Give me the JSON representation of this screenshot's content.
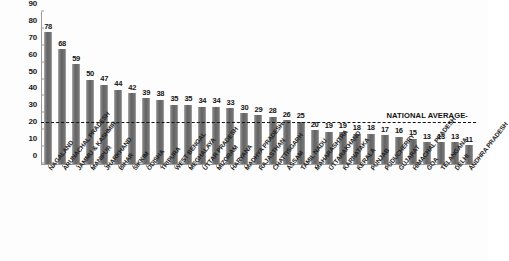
{
  "chart_data": {
    "type": "bar",
    "title": "",
    "subtitle": "",
    "xlabel": "",
    "ylabel": "",
    "ylim": [
      0,
      90
    ],
    "yticks": [
      0,
      10,
      20,
      30,
      40,
      50,
      60,
      70,
      80,
      90
    ],
    "grid": false,
    "legend": null,
    "bar_color": "#6e6e6e",
    "categories": [
      "NAGALAND",
      "ARUNACHAL PRADESH",
      "JAMMU & KASHMIR",
      "MANIPUR",
      "JHARKHAND",
      "BIHAR",
      "SIKKIM",
      "ODISHA",
      "TRIPURA",
      "WEST BENGAL",
      "MEGHALAYA",
      "UTTAR PRADESH",
      "MIZORAM",
      "HARYANA",
      "MADHYA PRADESH",
      "RAJASTHAN",
      "CHATTISGARH",
      "ASSAM",
      "TAMIL NADU",
      "MAHARASHTRA",
      "UTTARAKHAND",
      "KARNATAKA",
      "KERALA",
      "PUNJAB",
      "PUDUCHERRY",
      "GUJARAT",
      "HIMACHAL PRADESH",
      "GOA",
      "TELANGANA",
      "DELHI",
      "ANDHRA PRADESH"
    ],
    "values": [
      78,
      68,
      59,
      50,
      47,
      44,
      42,
      39,
      38,
      35,
      35,
      34,
      34,
      33,
      30,
      29,
      28,
      26,
      25,
      20,
      19,
      19,
      18,
      18,
      17,
      16,
      15,
      13,
      13,
      13,
      11
    ],
    "annotations": [
      {
        "name": "national-average",
        "label": "NATIONAL AVERAGE-",
        "type": "hline",
        "value": 24
      }
    ]
  }
}
